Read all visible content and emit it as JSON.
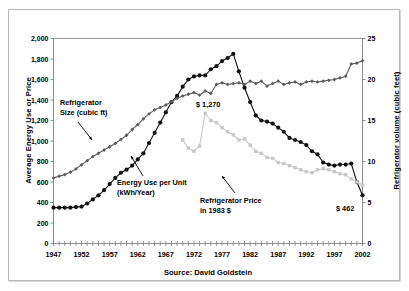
{
  "figure": {
    "source_note": "Source: David Goldstein"
  },
  "annotations": {
    "size": {
      "line1": "Refrigerator",
      "line2": "Size (cubic ft)"
    },
    "energy": {
      "line1": "Energy Use per Unit",
      "line2": "(kWh/Year)"
    },
    "price": {
      "line1": "Refrigerator Price",
      "line2": "in 1983 $"
    },
    "peak_price": "$ 1,270",
    "end_price": "$ 462"
  },
  "colors": {
    "energy_use": "#111111",
    "refrigerator_size": "#5d5d5d",
    "refrigerator_price": "#c8c8c8",
    "axis": "#808080",
    "frame": "#b9b9b9",
    "background": "#ffffff"
  },
  "chart_data": {
    "type": "line",
    "title": "",
    "subtitle": "",
    "xlabel": "",
    "ylabel": "Average Energy Use or Price",
    "y2label": "Refrigerator volume (cubic feet)",
    "xlim": [
      1947,
      2002
    ],
    "ylim": [
      0,
      2000
    ],
    "y2lim": [
      0,
      25
    ],
    "ytick_values": [
      0,
      200,
      400,
      600,
      800,
      1000,
      1200,
      1400,
      1600,
      1800,
      2000
    ],
    "ytick_labels": [
      "0",
      "200",
      "400",
      "600",
      "800",
      "1,000",
      "1,200",
      "1,400",
      "1,600",
      "1,800",
      "2,000"
    ],
    "y2tick_values": [
      0,
      5,
      10,
      15,
      20,
      25
    ],
    "y2tick_labels": [
      "0",
      "5",
      "10",
      "15",
      "20",
      "25"
    ],
    "xtick_labels": [
      "1947",
      "1952",
      "1957",
      "1962",
      "1967",
      "1972",
      "1977",
      "1982",
      "1987",
      "1992",
      "1997",
      "2002"
    ],
    "xtick_values": [
      1947,
      1952,
      1957,
      1962,
      1967,
      1972,
      1977,
      1982,
      1987,
      1992,
      1997,
      2002
    ],
    "minor_xticks_every": 1,
    "grid": false,
    "legend": "annotations-inline",
    "series": [
      {
        "name": "Energy Use per Unit (kWh/Year)",
        "axis": "left",
        "color": "#111111",
        "marker": "circle",
        "x": [
          1947,
          1948,
          1949,
          1950,
          1951,
          1952,
          1953,
          1954,
          1955,
          1956,
          1957,
          1958,
          1959,
          1960,
          1961,
          1962,
          1963,
          1964,
          1965,
          1966,
          1967,
          1968,
          1969,
          1970,
          1971,
          1972,
          1973,
          1974,
          1975,
          1976,
          1977,
          1978,
          1979,
          1980,
          1981,
          1982,
          1983,
          1984,
          1985,
          1986,
          1987,
          1988,
          1989,
          1990,
          1991,
          1992,
          1993,
          1994,
          1995,
          1996,
          1997,
          1998,
          1999,
          2000,
          2001,
          2002
        ],
        "y": [
          350,
          350,
          350,
          350,
          355,
          360,
          390,
          430,
          470,
          520,
          580,
          640,
          690,
          720,
          760,
          820,
          880,
          980,
          1080,
          1180,
          1280,
          1380,
          1440,
          1530,
          1600,
          1630,
          1640,
          1640,
          1700,
          1730,
          1780,
          1810,
          1850,
          1680,
          1520,
          1380,
          1250,
          1200,
          1190,
          1170,
          1130,
          1090,
          1030,
          1010,
          990,
          960,
          900,
          870,
          790,
          770,
          760,
          770,
          770,
          780,
          600,
          470
        ]
      },
      {
        "name": "Refrigerator Size (cubic ft)",
        "axis": "right",
        "color": "#5d5d5d",
        "marker": "diamond",
        "x": [
          1947,
          1948,
          1949,
          1950,
          1951,
          1952,
          1953,
          1954,
          1955,
          1956,
          1957,
          1958,
          1959,
          1960,
          1961,
          1962,
          1963,
          1964,
          1965,
          1966,
          1967,
          1968,
          1969,
          1970,
          1971,
          1972,
          1973,
          1974,
          1975,
          1976,
          1977,
          1978,
          1979,
          1980,
          1981,
          1982,
          1983,
          1984,
          1985,
          1986,
          1987,
          1988,
          1989,
          1990,
          1991,
          1992,
          1993,
          1994,
          1995,
          1996,
          1997,
          1998,
          1999,
          2000,
          2001,
          2002
        ],
        "y": [
          8.0,
          8.2,
          8.4,
          8.7,
          9.1,
          9.6,
          10.1,
          10.6,
          11.0,
          11.4,
          11.8,
          12.2,
          12.7,
          13.2,
          13.9,
          14.5,
          15.2,
          15.8,
          16.3,
          16.6,
          16.9,
          17.3,
          17.7,
          18.0,
          18.2,
          18.4,
          18.1,
          18.6,
          18.3,
          19.4,
          19.6,
          19.4,
          19.5,
          19.6,
          19.4,
          19.8,
          19.5,
          19.8,
          19.2,
          19.5,
          19.8,
          19.4,
          19.6,
          19.7,
          19.4,
          19.7,
          19.8,
          19.7,
          19.8,
          19.9,
          20.0,
          20.2,
          20.4,
          21.9,
          22.0,
          22.3
        ]
      },
      {
        "name": "Refrigerator Price in 1983 $",
        "axis": "left",
        "color": "#c8c8c8",
        "marker": "square",
        "x": [
          1970,
          1971,
          1972,
          1973,
          1974,
          1975,
          1976,
          1977,
          1978,
          1979,
          1980,
          1981,
          1982,
          1983,
          1984,
          1985,
          1986,
          1987,
          1988,
          1989,
          1990,
          1991,
          1992,
          1993,
          1994,
          1995,
          1996,
          1997,
          1998,
          1999,
          2000,
          2001,
          2002
        ],
        "y": [
          1010,
          930,
          900,
          950,
          1270,
          1200,
          1180,
          1130,
          1090,
          1060,
          1010,
          1020,
          960,
          900,
          880,
          840,
          830,
          790,
          780,
          760,
          740,
          720,
          700,
          690,
          720,
          730,
          720,
          700,
          680,
          670,
          630,
          600,
          570
        ]
      }
    ]
  }
}
